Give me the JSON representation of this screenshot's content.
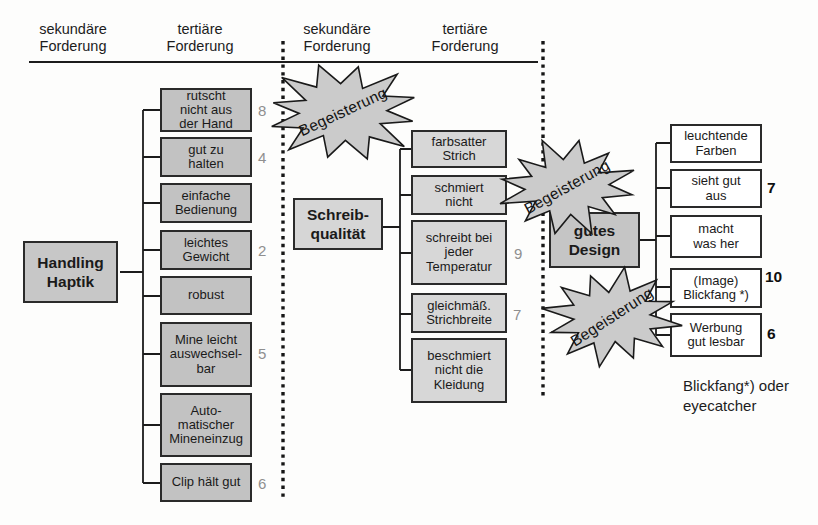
{
  "headers": [
    {
      "label": "sekundäre\nForderung"
    },
    {
      "label": "tertiäre\nForderung"
    },
    {
      "label": "sekundäre\nForderung"
    },
    {
      "label": "tertiäre\nForderung"
    }
  ],
  "groups": [
    {
      "secondary": "Handling\nHaptik",
      "tertiary": [
        {
          "label": "rutscht\nnicht aus\nder Hand",
          "score": "8"
        },
        {
          "label": "gut zu\nhalten",
          "score": "4"
        },
        {
          "label": "einfache\nBedienung",
          "score": ""
        },
        {
          "label": "leichtes\nGewicht",
          "score": "2"
        },
        {
          "label": "robust",
          "score": ""
        },
        {
          "label": "Mine leicht\nauswechsel-\nbar",
          "score": "5"
        },
        {
          "label": "Auto-\nmatischer\nMineneinzug",
          "score": ""
        },
        {
          "label": "Clip hält gut",
          "score": "6"
        }
      ]
    },
    {
      "secondary": "Schreib-\nqualität",
      "tertiary": [
        {
          "label": "farbsatter\nStrich",
          "score": ""
        },
        {
          "label": "schmiert\nnicht",
          "score": ""
        },
        {
          "label": "schreibt bei\njeder\nTemperatur",
          "score": "9"
        },
        {
          "label": "gleichmäß.\nStrichbreite",
          "score": "7"
        },
        {
          "label": "beschmiert\nnicht die\nKleidung",
          "score": ""
        }
      ]
    },
    {
      "secondary": "gutes\nDesign",
      "tertiary": [
        {
          "label": "leuchtende\nFarben",
          "score": ""
        },
        {
          "label": "sieht gut\naus",
          "score": "7"
        },
        {
          "label": "macht\nwas her",
          "score": ""
        },
        {
          "label": "(Image)\nBlickfang *)",
          "score": "10"
        },
        {
          "label": "Werbung\ngut lesbar",
          "score": "6"
        }
      ]
    }
  ],
  "starbursts": [
    {
      "label": "Begeisterung"
    },
    {
      "label": "Begeisterung"
    },
    {
      "label": "Begeisterung"
    }
  ],
  "footnote": "Blickfang*) oder\neyecatcher",
  "colors": {
    "box_grey_dark": "#c2c2c2",
    "box_grey_light": "#d7d7d7",
    "box_white": "#ffffff",
    "starburst_fill": "#cbcbcb",
    "score_grey": "#8f8f8f",
    "score_black": "#0f0f0f",
    "line": "#1c1c1c"
  }
}
